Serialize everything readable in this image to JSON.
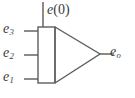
{
  "diagram": {
    "name": "summing-integrator-block-diagram",
    "type": "schematic",
    "line_color": "#6e6e6e",
    "outline_color": "#5e5e5e",
    "text_color": "#3a3a3a",
    "background_color": "#ffffff",
    "inputs": [
      {
        "id": "e3",
        "base": "e",
        "subscript": "3",
        "label": "e3",
        "wire_y": 31
      },
      {
        "id": "e2",
        "base": "e",
        "subscript": "2",
        "label": "e2",
        "wire_y": 55
      },
      {
        "id": "e1",
        "base": "e",
        "subscript": "1",
        "label": "e1",
        "wire_y": 79
      }
    ],
    "initial_condition": {
      "id": "e0",
      "base": "e",
      "argument": "(0)",
      "label": "e(0)",
      "wire_x": 43
    },
    "output": {
      "id": "eo",
      "base": "e",
      "subscript": "o",
      "label": "eo",
      "wire_y": 54
    },
    "shapes": {
      "rect": {
        "x": 38,
        "y": 27,
        "width": 17,
        "height": 56
      },
      "triangle": {
        "left_x": 55,
        "top_y": 27,
        "bottom_y": 83,
        "apex_x": 100,
        "apex_y": 54
      }
    }
  }
}
